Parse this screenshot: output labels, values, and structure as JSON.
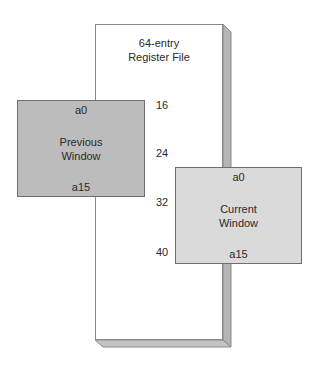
{
  "register_file": {
    "title_line1": "64-entry",
    "title_line2": "Register File"
  },
  "previous_window": {
    "top_register": "a0",
    "label_line1": "Previous",
    "label_line2": "Window",
    "bottom_register": "a15",
    "fill_color": "#bcbcbc"
  },
  "current_window": {
    "top_register": "a0",
    "label_line1": "Current",
    "label_line2": "Window",
    "bottom_register": "a15",
    "fill_color": "#dadada"
  },
  "index_labels": [
    "16",
    "24",
    "32",
    "40"
  ]
}
